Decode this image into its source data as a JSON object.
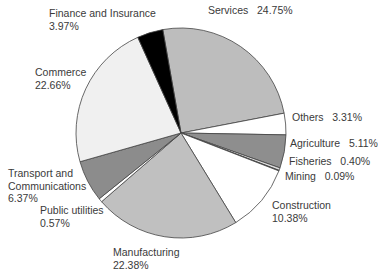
{
  "chart_data": {
    "type": "pie",
    "title": "",
    "start_angle_deg": -100,
    "direction": "clockwise",
    "center": [
      181,
      133
    ],
    "radius": 105,
    "slices": [
      {
        "name": "Services",
        "value": 24.75,
        "label": "Services   24.75%",
        "color": "#bdbdbd"
      },
      {
        "name": "Others",
        "value": 3.31,
        "label": "Others   3.31%",
        "color": "#ffffff"
      },
      {
        "name": "Agriculture",
        "value": 5.11,
        "label": "Agriculture   5.11%",
        "color": "#8e8e8e"
      },
      {
        "name": "Fisheries",
        "value": 0.4,
        "label": "Fisheries   0.40%",
        "color": "#dcdcdc"
      },
      {
        "name": "Mining",
        "value": 0.09,
        "label": "Mining   0.09%",
        "color": "#555555"
      },
      {
        "name": "Construction",
        "value": 10.38,
        "label": "Construction\n10.38%",
        "color": "#ffffff"
      },
      {
        "name": "Manufacturing",
        "value": 22.38,
        "label": "Manufacturing\n22.38%",
        "color": "#c0c0c0"
      },
      {
        "name": "Public utilities",
        "value": 0.57,
        "label": "Public utilities\n0.57%",
        "color": "#ffffff"
      },
      {
        "name": "Transport and Communications",
        "value": 6.37,
        "label": "Transport and\nCommunications\n6.37%",
        "color": "#8c8c8c"
      },
      {
        "name": "Commerce",
        "value": 22.66,
        "label": "Commerce\n22.66%",
        "color": "#f0f0f0"
      },
      {
        "name": "Finance and Insurance",
        "value": 3.97,
        "label": "Finance and Insurance\n3.97%",
        "color": "#000000"
      }
    ],
    "legend": "none (direct labels)"
  },
  "labels": [
    {
      "key": "services",
      "lines": [
        "Services   24.75%"
      ],
      "x": 208,
      "y": 4
    },
    {
      "key": "finance",
      "lines": [
        "Finance and Insurance",
        "3.97%"
      ],
      "x": 49,
      "y": 7
    },
    {
      "key": "commerce",
      "lines": [
        "Commerce",
        "22.66%"
      ],
      "x": 35,
      "y": 66
    },
    {
      "key": "others",
      "lines": [
        "Others   3.31%"
      ],
      "x": 292,
      "y": 111
    },
    {
      "key": "agriculture",
      "lines": [
        "Agriculture   5.11%"
      ],
      "x": 290,
      "y": 137
    },
    {
      "key": "fisheries",
      "lines": [
        "Fisheries   0.40%"
      ],
      "x": 289,
      "y": 155
    },
    {
      "key": "mining",
      "lines": [
        "Mining   0.09%"
      ],
      "x": 285,
      "y": 170
    },
    {
      "key": "transport",
      "lines": [
        "Transport and",
        "Communications",
        "6.37%"
      ],
      "x": 8,
      "y": 167
    },
    {
      "key": "utilities",
      "lines": [
        "Public utilities",
        "0.57%"
      ],
      "x": 40,
      "y": 204
    },
    {
      "key": "construction",
      "lines": [
        "Construction",
        "10.38%"
      ],
      "x": 272,
      "y": 199
    },
    {
      "key": "manufacturing",
      "lines": [
        "Manufacturing",
        "22.38%"
      ],
      "x": 113,
      "y": 246
    }
  ]
}
